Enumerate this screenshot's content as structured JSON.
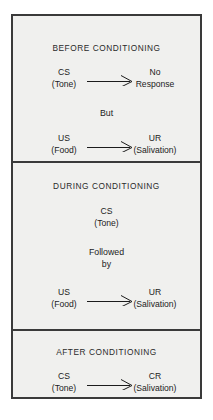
{
  "figure": {
    "border_color": "#3a3a3a",
    "background_color": "#f0f0ee",
    "page_background": "#ffffff",
    "text_color": "#1c1c1c"
  },
  "panels": [
    {
      "id": "before",
      "title": "BEFORE CONDITIONING",
      "relations": [
        {
          "left_abbr": "CS",
          "left_paren": "(Tone)",
          "arrow": "rightwards-arrow",
          "right_abbr": "No",
          "right_paren": "Response"
        },
        {
          "left_abbr": "US",
          "left_paren": "(Food)",
          "arrow": "rightwards-arrow",
          "right_abbr": "UR",
          "right_paren": "(Salivation)"
        }
      ],
      "connector": "But"
    },
    {
      "id": "during",
      "title": "DURING CONDITIONING",
      "single": {
        "abbr": "CS",
        "paren": "(Tone)"
      },
      "connector_line1": "Followed",
      "connector_line2": "by",
      "relations": [
        {
          "left_abbr": "US",
          "left_paren": "(Food)",
          "arrow": "rightwards-arrow",
          "right_abbr": "UR",
          "right_paren": "(Salivation)"
        }
      ]
    },
    {
      "id": "after",
      "title": "AFTER CONDITIONING",
      "relations": [
        {
          "left_abbr": "CS",
          "left_paren": "(Tone)",
          "arrow": "rightwards-arrow",
          "right_abbr": "CR",
          "right_paren": "(Salivation)"
        }
      ]
    }
  ]
}
